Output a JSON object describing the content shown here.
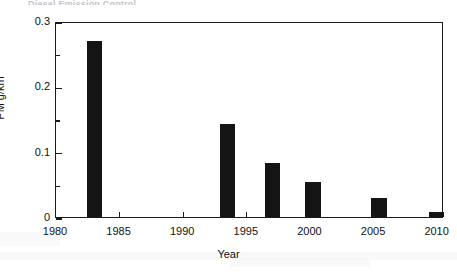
{
  "header": {
    "clipped_text": "Diesel Emission Control"
  },
  "axes": {
    "y_title": "PM g/km",
    "x_title": "Year",
    "y_ticks": [
      "0",
      "0.1",
      "0.2",
      "0.3"
    ],
    "x_ticks": [
      "1980",
      "1985",
      "1990",
      "1995",
      "2000",
      "2005",
      "2010"
    ]
  },
  "colors": {
    "bar": "#141414",
    "axis": "#1a1a1a",
    "background": "#ffffff",
    "text": "#111111"
  },
  "chart_data": {
    "type": "bar",
    "title": "",
    "xlabel": "Year",
    "ylabel": "PM g/km",
    "xlim": [
      1980,
      2010.5
    ],
    "ylim": [
      0,
      0.3
    ],
    "grid": false,
    "legend": false,
    "y_tick_values": [
      0,
      0.1,
      0.2,
      0.3
    ],
    "y_minor_tick_values": [
      0.05,
      0.15,
      0.25
    ],
    "x_tick_values": [
      1980,
      1985,
      1990,
      1995,
      2000,
      2005,
      2010
    ],
    "bar_width_years": 1.2,
    "x": [
      1983,
      1993.5,
      1997,
      2000.2,
      2005.4,
      2009.9
    ],
    "values": [
      0.27,
      0.142,
      0.082,
      0.053,
      0.029,
      0.008
    ],
    "categories": [
      "1983",
      "1993.5",
      "1997",
      "2000",
      "2005",
      "2010"
    ],
    "series": [
      {
        "name": "PM emission limit",
        "values": [
          0.27,
          0.142,
          0.082,
          0.053,
          0.029,
          0.008
        ]
      }
    ]
  }
}
